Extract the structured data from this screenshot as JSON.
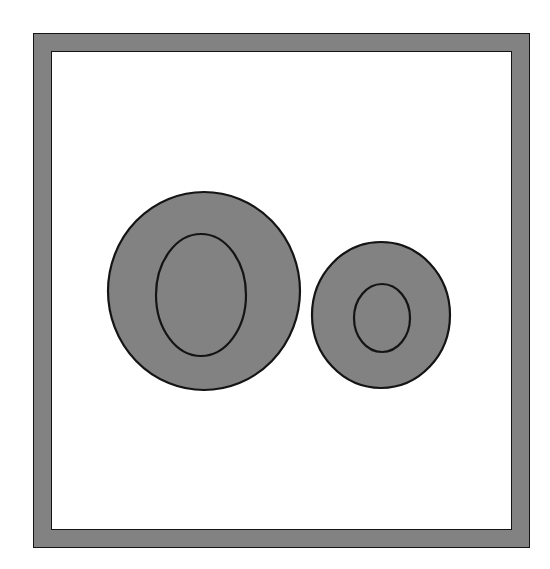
{
  "card": {
    "title": "Oo",
    "uppercase_letter": "O",
    "lowercase_letter": "o",
    "caption": "Oo"
  },
  "colors": {
    "background": "#ffffff",
    "letter_fill": "#828282",
    "letter_outline": "#141414",
    "frame_band": "#828282",
    "frame_outline": "#141414",
    "frame_interior": "#ffffff"
  },
  "frame": {
    "name": "square-picture-frame",
    "outer": {
      "x": 33,
      "y": 33,
      "width": 497,
      "height": 515
    },
    "band_thickness": 18
  },
  "glyphs": [
    {
      "name": "uppercase-o",
      "character": "O",
      "case": "uppercase",
      "outer": {
        "cx": 204,
        "cy": 291,
        "rx": 96,
        "ry": 99
      },
      "counter": {
        "cx": 201,
        "cy": 295,
        "rx": 45,
        "ry": 61
      }
    },
    {
      "name": "lowercase-o",
      "character": "o",
      "case": "lowercase",
      "outer": {
        "cx": 381,
        "cy": 315,
        "rx": 69,
        "ry": 73
      },
      "counter": {
        "cx": 382,
        "cy": 318,
        "rx": 28,
        "ry": 34
      }
    }
  ]
}
